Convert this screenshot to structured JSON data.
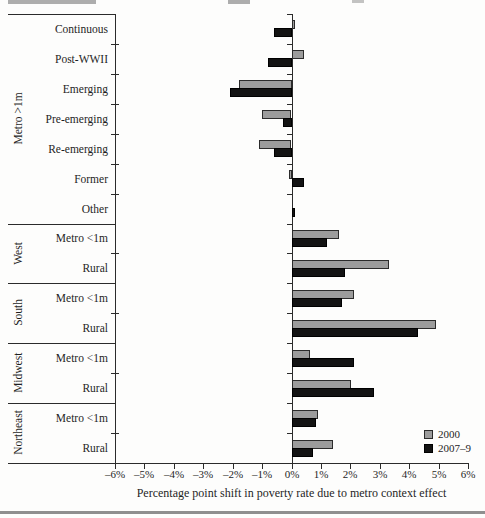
{
  "figure": {
    "bottom_rule": true
  },
  "chart_data": {
    "type": "bar",
    "orientation": "horizontal",
    "title": "",
    "xlabel": "Percentage point shift in poverty rate due to metro context effect",
    "ylabel": "",
    "unit": "%",
    "xlim": [
      -6,
      6
    ],
    "x_tick_step": 1,
    "x_tick_labels": [
      "–6%",
      "–5%",
      "–4%",
      "–3%",
      "–2%",
      "–1%",
      "0%",
      "1%",
      "2%",
      "3%",
      "4%",
      "5%",
      "6%"
    ],
    "grid": false,
    "legend_position": "bottom-right",
    "series": [
      {
        "name": "2000",
        "color": "#9c9c9c"
      },
      {
        "name": "2007–9",
        "color": "#131313"
      }
    ],
    "groups": [
      {
        "label": "Metro >1m",
        "rows": [
          {
            "label": "Continuous",
            "values": [
              0.1,
              -0.6
            ]
          },
          {
            "label": "Post-WWII",
            "values": [
              0.4,
              -0.8
            ]
          },
          {
            "label": "Emerging",
            "values": [
              -1.8,
              -2.1
            ]
          },
          {
            "label": "Pre-emerging",
            "values": [
              -1.0,
              -0.3
            ]
          },
          {
            "label": "Re-emerging",
            "values": [
              -1.1,
              -0.6
            ]
          },
          {
            "label": "Former",
            "values": [
              -0.1,
              0.4
            ]
          },
          {
            "label": "Other",
            "values": [
              0.0,
              0.1
            ]
          }
        ]
      },
      {
        "label": "West",
        "rows": [
          {
            "label": "Metro <1m",
            "values": [
              1.6,
              1.2
            ]
          },
          {
            "label": "Rural",
            "values": [
              3.3,
              1.8
            ]
          }
        ]
      },
      {
        "label": "South",
        "rows": [
          {
            "label": "Metro <1m",
            "values": [
              2.1,
              1.7
            ]
          },
          {
            "label": "Rural",
            "values": [
              4.9,
              4.3
            ]
          }
        ]
      },
      {
        "label": "Midwest",
        "rows": [
          {
            "label": "Metro <1m",
            "values": [
              0.6,
              2.1
            ]
          },
          {
            "label": "Rural",
            "values": [
              2.0,
              2.8
            ]
          }
        ]
      },
      {
        "label": "Northeast",
        "rows": [
          {
            "label": "Metro <1m",
            "values": [
              0.9,
              0.8
            ]
          },
          {
            "label": "Rural",
            "values": [
              1.4,
              0.7
            ]
          }
        ]
      }
    ]
  }
}
